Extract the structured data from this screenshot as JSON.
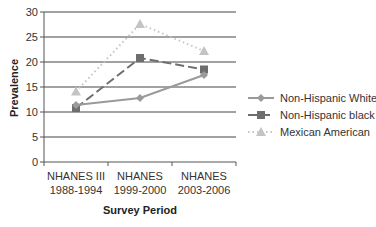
{
  "chart_data": {
    "type": "line",
    "title": "",
    "xlabel": "Survey Period",
    "ylabel": "Prevalence",
    "ylim": [
      0,
      30
    ],
    "yticks": [
      0,
      5,
      10,
      15,
      20,
      25,
      30
    ],
    "grid": true,
    "legend_position": "right",
    "categories": [
      {
        "line1": "NHANES III",
        "line2": "1988-1994"
      },
      {
        "line1": "NHANES",
        "line2": "1999-2000"
      },
      {
        "line1": "NHANES",
        "line2": "2003-2006"
      }
    ],
    "series": [
      {
        "name": "Non-Hispanic White",
        "values": [
          11.4,
          12.8,
          17.4
        ],
        "color": "#9a9a9a",
        "marker": "diamond",
        "dash": "solid"
      },
      {
        "name": "Non-Hispanic black",
        "values": [
          10.8,
          20.8,
          18.5
        ],
        "color": "#6e6e6e",
        "marker": "square",
        "dash": "dashed"
      },
      {
        "name": "Mexican American",
        "values": [
          14.1,
          27.6,
          22.2
        ],
        "color": "#c4c4c4",
        "marker": "triangle",
        "dash": "dotted"
      }
    ]
  }
}
